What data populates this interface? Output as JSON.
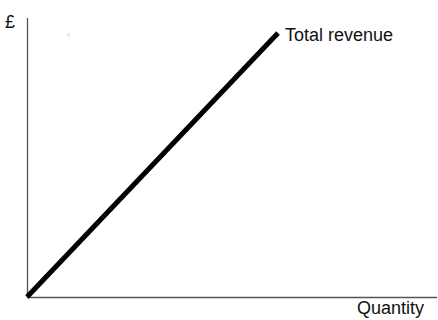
{
  "figure": {
    "background_color": "#ffffff",
    "width": 438,
    "height": 320
  },
  "labels": {
    "y_axis": "£",
    "x_axis": "Quantity",
    "series": "Total revenue"
  },
  "style": {
    "axis_color": "#555555",
    "series_color": "#000000",
    "text_color": "#111111",
    "axis_width": 1,
    "series_width": 5
  },
  "chart_data": {
    "type": "line",
    "title": "",
    "subtitle": "",
    "xlabel": "Quantity",
    "ylabel": "£",
    "grid": false,
    "legend": "none",
    "annotations": [
      {
        "text": "Total revenue",
        "attached_to_series": "Total revenue",
        "position": "end-of-line-right"
      }
    ],
    "axes": {
      "x_axis_shown": true,
      "y_axis_shown": true,
      "x_ticks": [],
      "y_ticks": [],
      "xlim": [
        0,
        1
      ],
      "ylim": [
        0,
        1
      ],
      "origin_px": [
        27,
        297
      ]
    },
    "series": [
      {
        "name": "Total revenue",
        "color": "#000000",
        "linewidth": 5,
        "relationship": "linear through origin",
        "x": [
          0,
          1
        ],
        "y": [
          0,
          1
        ],
        "points_px": [
          [
            27,
            297
          ],
          [
            278,
            33
          ]
        ]
      }
    ]
  }
}
